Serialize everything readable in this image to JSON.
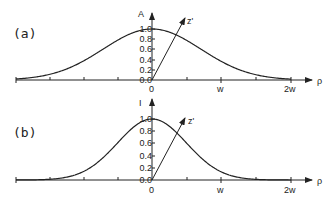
{
  "panels": [
    {
      "label": "(a)",
      "y_axis_label": "A",
      "x_axis_label": "ρ",
      "oblique_axis_label": "z'",
      "y_ticks": [
        "1.0",
        "0.8",
        "0.6",
        "0.4",
        "0.2",
        "0.0"
      ],
      "x_ticks": [
        "0",
        "w",
        "2w"
      ],
      "curve": "Gaussian amplitude profile A(ρ) = exp(-ρ²/w²)"
    },
    {
      "label": "(b)",
      "y_axis_label": "I",
      "x_axis_label": "ρ",
      "oblique_axis_label": "z'",
      "y_ticks": [
        "1.0",
        "0.8",
        "0.6",
        "0.4",
        "0.2",
        "0.0"
      ],
      "x_ticks": [
        "0",
        "w",
        "2w"
      ],
      "curve": "Gaussian intensity profile I(ρ) = exp(-2ρ²/w²)"
    }
  ],
  "chart_data": [
    {
      "type": "line",
      "title": "(a)",
      "xlabel": "ρ",
      "ylabel": "A",
      "x_tick_labels": [
        "0",
        "w",
        "2w"
      ],
      "x": [
        -2,
        -1.5,
        -1,
        -0.5,
        0,
        0.5,
        1,
        1.5,
        2
      ],
      "values": [
        0.02,
        0.11,
        0.37,
        0.78,
        1.0,
        0.78,
        0.37,
        0.11,
        0.02
      ],
      "ylim": [
        0,
        1.0
      ],
      "y_ticks": [
        0.0,
        0.2,
        0.4,
        0.6,
        0.8,
        1.0
      ],
      "grid": false
    },
    {
      "type": "line",
      "title": "(b)",
      "xlabel": "ρ",
      "ylabel": "I",
      "x_tick_labels": [
        "0",
        "w",
        "2w"
      ],
      "x": [
        -2,
        -1.5,
        -1,
        -0.5,
        0,
        0.5,
        1,
        1.5,
        2
      ],
      "values": [
        0.0,
        0.01,
        0.14,
        0.61,
        1.0,
        0.61,
        0.14,
        0.01,
        0.0
      ],
      "ylim": [
        0,
        1.0
      ],
      "y_ticks": [
        0.0,
        0.2,
        0.4,
        0.6,
        0.8,
        1.0
      ],
      "grid": false
    }
  ]
}
